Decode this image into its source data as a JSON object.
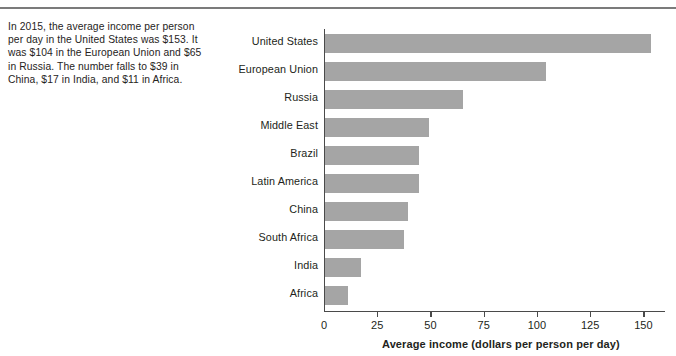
{
  "caption": {
    "text": "In 2015, the average income per person per day in the United States was $153. It was $104 in the European Union and $65 in Russia. The number falls to $39 in China, $17 in India, and $11 in Africa."
  },
  "chart_data": {
    "type": "bar",
    "orientation": "horizontal",
    "title": "",
    "xlabel": "Average income (dollars per person per day)",
    "ylabel": "",
    "categories": [
      "United States",
      "European Union",
      "Russia",
      "Middle East",
      "Brazil",
      "Latin America",
      "China",
      "South Africa",
      "India",
      "Africa"
    ],
    "values": [
      153,
      104,
      65,
      49,
      44,
      44,
      39,
      37,
      17,
      11
    ],
    "xlim": [
      0,
      160
    ],
    "xticks": [
      0,
      25,
      50,
      75,
      100,
      125,
      150
    ],
    "xtick_labels": [
      "0",
      "25",
      "50",
      "75",
      "100",
      "125",
      "150"
    ],
    "grid": false,
    "legend": false,
    "bar_color": "#a5a5a5",
    "axis_color": "#4a4a4a"
  },
  "rule": {
    "color": "#7b7b7b"
  }
}
